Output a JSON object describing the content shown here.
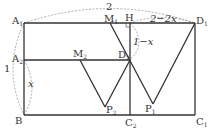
{
  "diagram": {
    "points": {
      "A1": {
        "label": "A",
        "sub": "1"
      },
      "A2": {
        "label": "A",
        "sub": "2"
      },
      "B": {
        "label": "B",
        "sub": ""
      },
      "M1": {
        "label": "M",
        "sub": "1"
      },
      "H": {
        "label": "H",
        "sub": ""
      },
      "D1": {
        "label": "D",
        "sub": "1"
      },
      "D2": {
        "label": "D",
        "sub": "2"
      },
      "M2": {
        "label": "M",
        "sub": "2"
      },
      "P1": {
        "label": "P",
        "sub": "1"
      },
      "P2": {
        "label": "P",
        "sub": "2"
      },
      "C1": {
        "label": "C",
        "sub": "1"
      },
      "C2": {
        "label": "C",
        "sub": "2"
      }
    },
    "measures": {
      "top_arc": "2",
      "left_arc": "1",
      "left_inner_arc": "x",
      "h_to_d1": "2−2x",
      "h_to_d2": "1−x"
    }
  }
}
